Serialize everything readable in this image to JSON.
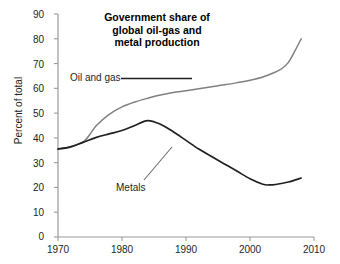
{
  "chart_data": {
    "type": "line",
    "title": "Government share of global oil-gas and metal production",
    "title_lines": [
      "Government share of",
      "global oil-gas and",
      "metal production"
    ],
    "xlabel": "",
    "ylabel": "Percent of total",
    "xlim": [
      1970,
      2010
    ],
    "ylim": [
      0,
      90
    ],
    "xticks": [
      1970,
      1980,
      1990,
      2000,
      2010
    ],
    "yticks": [
      0,
      10,
      20,
      30,
      40,
      50,
      60,
      70,
      80,
      90
    ],
    "grid": false,
    "legend_position": "inline-annotations",
    "series": [
      {
        "name": "Oil and gas",
        "color": "#808080",
        "x": [
          1970,
          1972,
          1974,
          1975,
          1976,
          1978,
          1980,
          1982,
          1984,
          1986,
          1988,
          1990,
          1992,
          1994,
          1996,
          1998,
          2000,
          2002,
          2004,
          2005,
          2006,
          2007,
          2008
        ],
        "values": [
          35.5,
          36.5,
          38.5,
          41.5,
          45.0,
          49.5,
          52.5,
          54.5,
          56.0,
          57.3,
          58.3,
          59.0,
          59.8,
          60.6,
          61.4,
          62.3,
          63.3,
          64.6,
          66.6,
          68.0,
          70.5,
          75.0,
          80.0
        ]
      },
      {
        "name": "Metals",
        "color": "#231f20",
        "x": [
          1970,
          1972,
          1974,
          1976,
          1978,
          1980,
          1982,
          1984,
          1986,
          1988,
          1990,
          1992,
          1994,
          1996,
          1998,
          2000,
          2002,
          2003,
          2004,
          2006,
          2008
        ],
        "values": [
          35.5,
          36.4,
          38.3,
          40.2,
          41.6,
          43.0,
          45.0,
          47.0,
          45.5,
          42.5,
          39.0,
          35.5,
          32.5,
          29.5,
          26.5,
          23.5,
          21.3,
          21.0,
          21.2,
          22.2,
          23.8
        ]
      }
    ],
    "annotations": [
      {
        "name": "oil-and-gas-label",
        "text": "Oil and gas",
        "leader": "horizontal"
      },
      {
        "name": "metals-label",
        "text": "Metals",
        "leader": "diagonal"
      }
    ]
  },
  "axes": {
    "y_title": "Percent of total",
    "y_tick_labels": [
      "90",
      "80",
      "70",
      "60",
      "50",
      "40",
      "30",
      "20",
      "10",
      "0"
    ],
    "x_tick_labels": [
      "1970",
      "1980",
      "1990",
      "2000",
      "2010"
    ]
  },
  "colors": {
    "oil_and_gas": "#808080",
    "metals": "#231f20",
    "axis": "#9a9a9a",
    "background": "#ffffff"
  }
}
